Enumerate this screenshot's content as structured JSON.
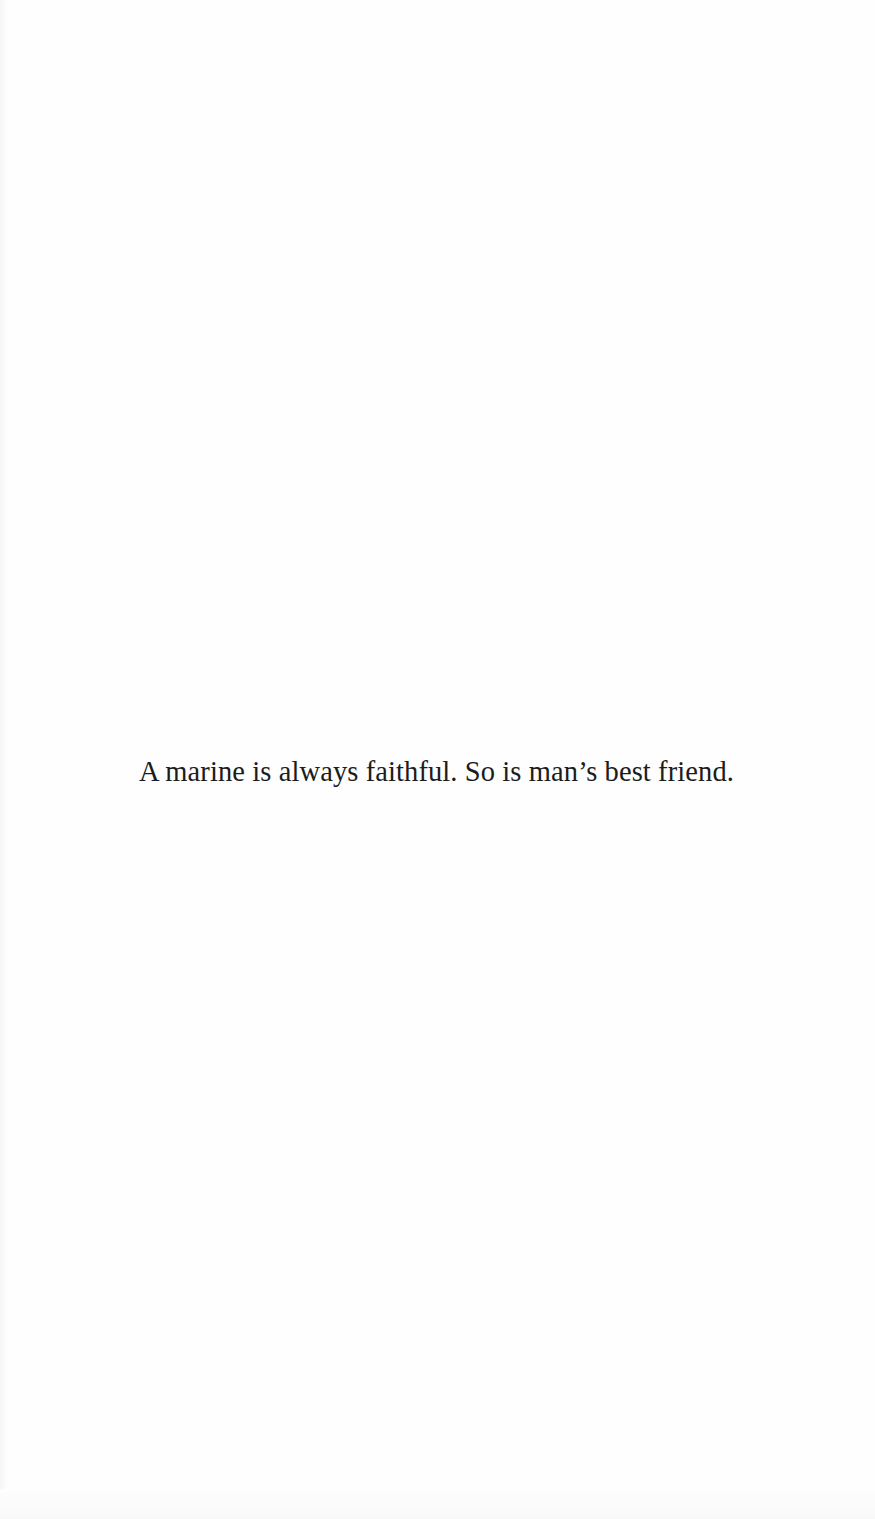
{
  "page": {
    "background_color": "#fefefe",
    "text_color": "#1c1c1c"
  },
  "epigraph": {
    "text": "A marine is always faithful. So is man’s best friend."
  }
}
